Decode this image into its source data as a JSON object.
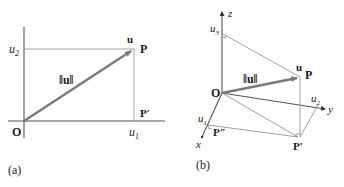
{
  "figure": {
    "panel_a": {
      "caption": "(a)",
      "origin_label": "O",
      "point_label": "P",
      "projection_label": "P′",
      "vector_label": "u",
      "norm_label": "‖u‖",
      "u1_label": "u",
      "u1_sub": "1",
      "u2_label": "u",
      "u2_sub": "2"
    },
    "panel_b": {
      "caption": "(b)",
      "origin_label": "O",
      "point_label": "P",
      "projection_label": "P′",
      "projection2_label": "P″",
      "vector_label": "u",
      "norm_label": "‖u‖",
      "x_axis_label": "x",
      "y_axis_label": "y",
      "z_axis_label": "z",
      "u1_label": "u",
      "u1_sub": "1",
      "u2_label": "u",
      "u2_sub": "2",
      "u3_label": "u",
      "u3_sub": "3"
    },
    "colors": {
      "vector": "#7a7a7a",
      "axis": "#555555",
      "guide": "#8a8a8a",
      "text": "#1a1a1a"
    }
  }
}
